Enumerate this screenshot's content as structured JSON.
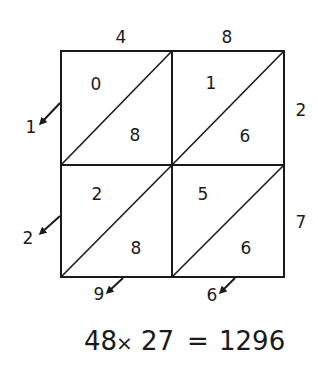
{
  "multiplicand_digits": [
    "4",
    "8"
  ],
  "multiplier_digits": [
    "2",
    "7"
  ],
  "cells": [
    [
      {
        "tens": "0",
        "ones": "8"
      },
      {
        "tens": "1",
        "ones": "6"
      }
    ],
    [
      {
        "tens": "2",
        "ones": "8"
      },
      {
        "tens": "5",
        "ones": "6"
      }
    ]
  ],
  "result_left": [
    "1",
    "2"
  ],
  "result_bottom": [
    "9",
    "6"
  ],
  "equation": {
    "a": "48",
    "op": "×",
    "b": "27",
    "eq": "=",
    "product": "1296"
  }
}
